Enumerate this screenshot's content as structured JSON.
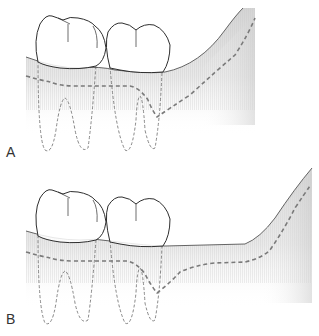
{
  "figure": {
    "panels": [
      {
        "id": "A",
        "label": "A",
        "description": "Mandibular molars with gingiva rising steeply behind the last molar; bone crest line descends to distal of second molar then rises"
      },
      {
        "id": "B",
        "label": "B",
        "description": "Mandibular molars with gingiva level behind the last molar before rising; bone crest line flattens behind the tooth before rising"
      }
    ],
    "colors": {
      "outline": "#2e2e2e",
      "dashed": "#7a7a7a",
      "tissue_top": "#d9d9d9",
      "tissue_bottom": "#ffffff",
      "background": "#ffffff"
    }
  }
}
